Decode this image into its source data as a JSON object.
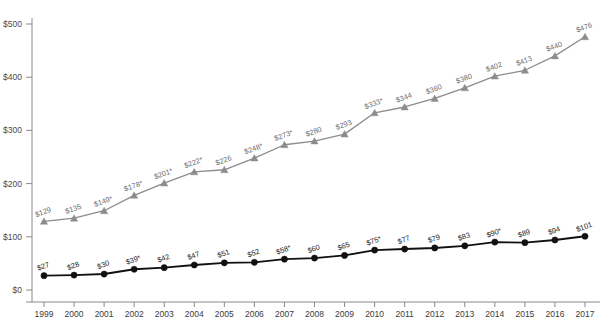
{
  "chart_data": {
    "type": "line",
    "title": "",
    "subtitle": "",
    "xlabel": "",
    "ylabel": "",
    "grid": false,
    "legend_position": "none",
    "x": [
      1999,
      2000,
      2001,
      2002,
      2003,
      2004,
      2005,
      2006,
      2007,
      2008,
      2009,
      2010,
      2011,
      2012,
      2013,
      2014,
      2015,
      2016,
      2017
    ],
    "categories": [
      "1999",
      "2000",
      "2001",
      "2002",
      "2003",
      "2004",
      "2005",
      "2006",
      "2007",
      "2008",
      "2009",
      "2010",
      "2011",
      "2012",
      "2013",
      "2014",
      "2015",
      "2016",
      "2017"
    ],
    "ylim": [
      0,
      500
    ],
    "yticks": [
      0,
      100,
      200,
      300,
      400,
      500
    ],
    "ytick_labels": [
      "$0",
      "$100",
      "$200",
      "$300",
      "$400",
      "$500"
    ],
    "series": [
      {
        "name": "upper-series",
        "marker": "triangle",
        "color": "#8c8c8c",
        "values": [
          129,
          135,
          149,
          178,
          201,
          222,
          226,
          248,
          273,
          280,
          293,
          333,
          344,
          360,
          380,
          402,
          413,
          440,
          476
        ],
        "labels": [
          "$129",
          "$135",
          "$149*",
          "$178*",
          "$201*",
          "$222*",
          "$226",
          "$248*",
          "$273*",
          "$280",
          "$293",
          "$333*",
          "$344",
          "$360",
          "$380",
          "$402",
          "$413",
          "$440",
          "$476"
        ]
      },
      {
        "name": "lower-series",
        "marker": "circle",
        "color": "#111111",
        "values": [
          27,
          28,
          30,
          39,
          42,
          47,
          51,
          52,
          58,
          60,
          65,
          75,
          77,
          79,
          83,
          90,
          89,
          94,
          101
        ],
        "labels": [
          "$27",
          "$28",
          "$30",
          "$39*",
          "$42",
          "$47",
          "$51",
          "$52",
          "$58*",
          "$60",
          "$65",
          "$75*",
          "$77",
          "$79",
          "$83",
          "$90*",
          "$89",
          "$94",
          "$101"
        ]
      }
    ]
  },
  "axes": {
    "y_axis_name": "y-axis",
    "x_axis_name": "x-axis"
  }
}
